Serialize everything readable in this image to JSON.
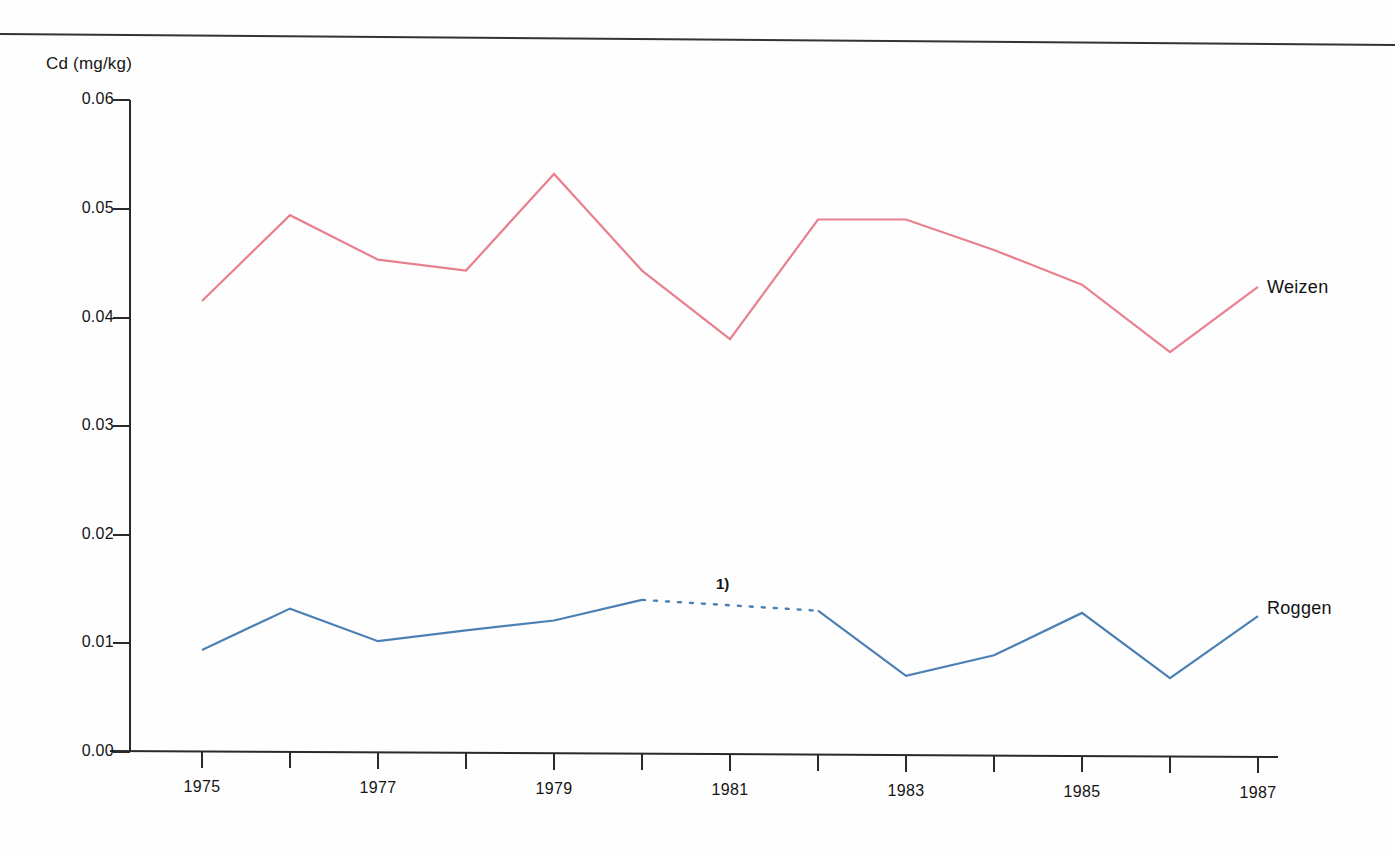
{
  "axis_title": "Cd (mg/kg)",
  "series_labels": {
    "wheat": "Weizen",
    "rye": "Roggen"
  },
  "annotation": "1)",
  "colors": {
    "wheat": "#e8808e",
    "rye": "#4b80b4",
    "axis": "#2a2a2a",
    "text": "#141414"
  },
  "chart_data": {
    "type": "line",
    "title": "",
    "subtitle": "",
    "xlabel": "",
    "ylabel": "Cd (mg/kg)",
    "xlim": [
      1975,
      1987
    ],
    "ylim": [
      0.0,
      0.06
    ],
    "grid": false,
    "legend_position": "right-inline",
    "x": [
      1975,
      1976,
      1977,
      1978,
      1979,
      1980,
      1981,
      1982,
      1983,
      1984,
      1985,
      1986,
      1987
    ],
    "xtick_labels": [
      "1975",
      "",
      "1977",
      "",
      "1979",
      "",
      "1981",
      "",
      "1983",
      "",
      "1985",
      "",
      "1987"
    ],
    "ytick_labels": [
      "0.00",
      "0.01",
      "0.02",
      "0.03",
      "0.04",
      "0.05",
      "0.06"
    ],
    "yticks": [
      0.0,
      0.01,
      0.02,
      0.03,
      0.04,
      0.05,
      0.06
    ],
    "series": [
      {
        "name": "Weizen",
        "color": "#e8808e",
        "values": [
          0.0415,
          0.0494,
          0.0453,
          0.0443,
          0.0532,
          0.0443,
          0.038,
          0.049,
          0.049,
          0.0462,
          0.043,
          0.0368,
          0.0428
        ],
        "dashed_segment": null
      },
      {
        "name": "Roggen",
        "color": "#4b80b4",
        "values": [
          0.0094,
          0.0132,
          0.0102,
          0.0112,
          0.0121,
          0.014,
          0.0135,
          0.013,
          0.007,
          0.0089,
          0.0128,
          0.0068,
          0.0125
        ],
        "dashed_segment": [
          1980,
          1982
        ]
      }
    ],
    "annotations": [
      {
        "text": "1)",
        "x": 1981,
        "y": 0.0155
      }
    ]
  }
}
